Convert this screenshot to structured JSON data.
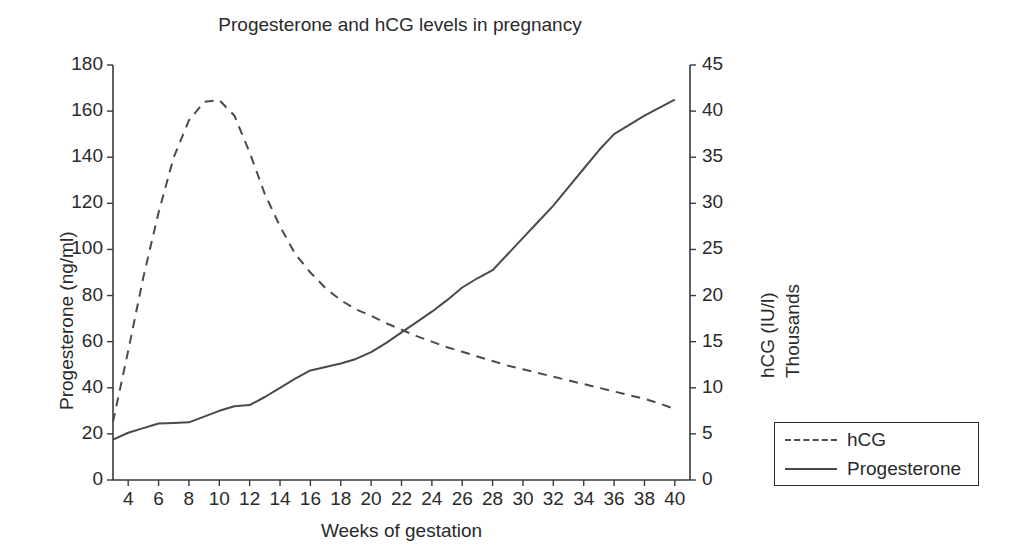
{
  "chart_data": {
    "type": "line",
    "title": "Progesterone and hCG levels in pregnancy",
    "xlabel": "Weeks of gestation",
    "ylabel": "Progesterone (ng/ml)",
    "ylabel_right_line1": "hCG (IU/l)",
    "ylabel_right_line2": "Thousands",
    "grid": false,
    "legend_position": "right-outside-bottom",
    "xlim": [
      3,
      41
    ],
    "ylim": [
      0,
      180
    ],
    "ylim_right": [
      0,
      45
    ],
    "xticks": [
      4,
      6,
      8,
      10,
      12,
      14,
      16,
      18,
      20,
      22,
      24,
      26,
      28,
      30,
      32,
      34,
      36,
      38,
      40
    ],
    "yticks": [
      0,
      20,
      40,
      60,
      80,
      100,
      120,
      140,
      160,
      180
    ],
    "yticks_right": [
      0,
      5,
      10,
      15,
      20,
      25,
      30,
      35,
      40,
      45
    ],
    "x": [
      3,
      4,
      5,
      6,
      7,
      8,
      9,
      10,
      11,
      12,
      13,
      14,
      15,
      16,
      17,
      18,
      19,
      20,
      21,
      22,
      23,
      24,
      25,
      26,
      27,
      28,
      29,
      30,
      31,
      32,
      33,
      34,
      35,
      36,
      37,
      38,
      39,
      40
    ],
    "series": [
      {
        "name": "hCG",
        "axis": "right",
        "units": "Thousands IU/l",
        "style": "dashed",
        "color": "#4a4a4a",
        "values": [
          6.3,
          14.0,
          22.0,
          29.0,
          35.0,
          39.0,
          41.0,
          41.2,
          39.5,
          35.5,
          31.0,
          27.5,
          24.5,
          22.5,
          20.8,
          19.5,
          18.5,
          17.8,
          17.0,
          16.3,
          15.6,
          15.0,
          14.4,
          13.9,
          13.4,
          12.9,
          12.4,
          12.0,
          11.6,
          11.2,
          10.8,
          10.4,
          10.0,
          9.6,
          9.2,
          8.8,
          8.3,
          7.7
        ]
      },
      {
        "name": "Progesterone",
        "axis": "left",
        "units": "ng/ml",
        "style": "solid",
        "color": "#4a4a4a",
        "values": [
          17.5,
          20.5,
          22.5,
          24.5,
          24.7,
          25.0,
          27.5,
          30.0,
          32.0,
          32.5,
          36.0,
          40.0,
          44.0,
          47.5,
          49.0,
          50.5,
          52.5,
          55.5,
          59.5,
          64.0,
          68.5,
          73.0,
          78.0,
          83.5,
          87.5,
          91.0,
          98.0,
          105.0,
          112.0,
          119.0,
          127.0,
          135.0,
          143.0,
          150.0,
          154.0,
          158.0,
          161.5,
          165.0
        ]
      }
    ],
    "annotations": {
      "hcg_peak_week": 10,
      "hcg_peak_value": 41.2,
      "crossover_week": 21.5
    }
  },
  "legend": {
    "items": [
      {
        "label": "hCG",
        "style": "dashed"
      },
      {
        "label": "Progesterone",
        "style": "solid"
      }
    ]
  }
}
